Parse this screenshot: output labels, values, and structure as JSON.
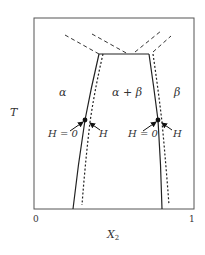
{
  "diagram": {
    "axes": {
      "y_label": "T",
      "x_label": "X",
      "x_label_subscript": "2",
      "x_min_label": "0",
      "x_max_label": "1"
    },
    "regions": {
      "alpha": "α",
      "alpha_beta": "α + β",
      "beta": "β"
    },
    "annotations": {
      "left_h0": "H = 0",
      "left_h": "H",
      "right_h0": "H = 0",
      "right_h": "H"
    },
    "colors": {
      "line": "#222222",
      "frame": "#555555",
      "text": "#333333"
    }
  }
}
